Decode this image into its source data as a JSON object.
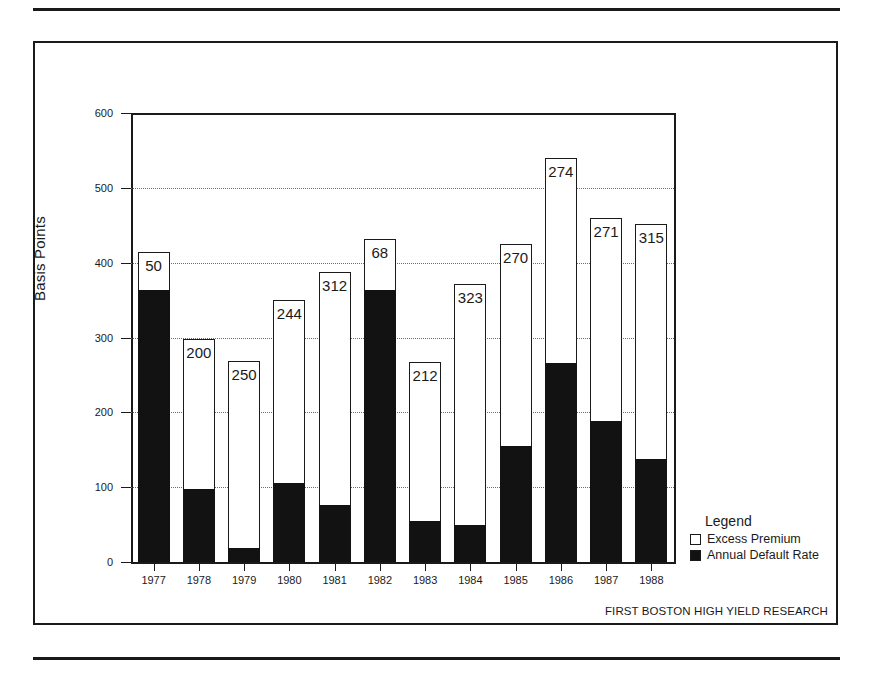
{
  "figure": {
    "y_axis_title": "Basis Points",
    "source_note": "FIRST BOSTON HIGH YIELD RESEARCH"
  },
  "legend": {
    "title": "Legend",
    "items": [
      {
        "label": "Excess Premium",
        "swatch": "white-square-icon",
        "color": "#ffffff"
      },
      {
        "label": "Annual Default Rate",
        "swatch": "black-square-icon",
        "color": "#121212"
      }
    ]
  },
  "chart_data": {
    "type": "bar",
    "title": "",
    "subtitle": "",
    "xlabel": "",
    "ylabel": "Basis Points",
    "ylim": [
      0,
      600
    ],
    "yticks": [
      0,
      100,
      200,
      300,
      400,
      500,
      600
    ],
    "ytick_labels": [
      "0",
      "100",
      "200",
      "300",
      "400",
      "500",
      "600"
    ],
    "grid": true,
    "grid_style": "dotted-horizontal",
    "legend_position": "right-bottom",
    "stacked": true,
    "categories": [
      "1977",
      "1978",
      "1979",
      "1980",
      "1981",
      "1982",
      "1983",
      "1984",
      "1985",
      "1986",
      "1987",
      "1988"
    ],
    "series": [
      {
        "name": "Annual Default Rate",
        "color": "#121212",
        "values": [
          364,
          98,
          19,
          106,
          76,
          364,
          55,
          49,
          155,
          266,
          189,
          137
        ]
      },
      {
        "name": "Excess Premium",
        "color": "#ffffff",
        "values": [
          50,
          200,
          250,
          244,
          312,
          68,
          212,
          323,
          270,
          274,
          271,
          315
        ],
        "data_labels": [
          "50",
          "200",
          "250",
          "244",
          "312",
          "68",
          "212",
          "323",
          "270",
          "274",
          "271",
          "315"
        ]
      }
    ],
    "totals": [
      414,
      298,
      269,
      350,
      388,
      432,
      267,
      372,
      425,
      540,
      460,
      452
    ]
  }
}
